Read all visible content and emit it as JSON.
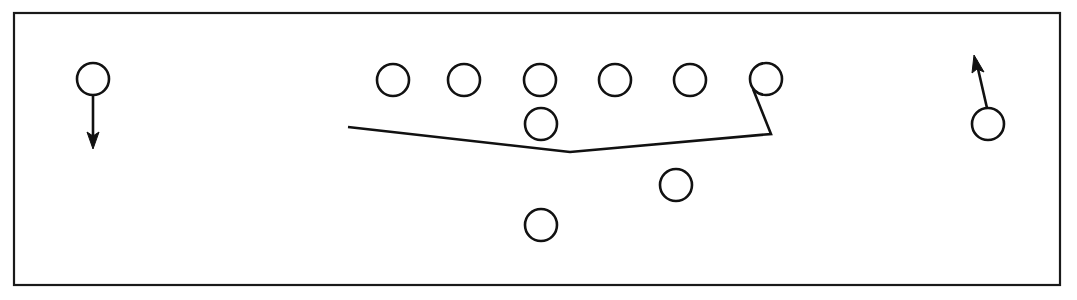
{
  "diagram": {
    "type": "football-play-diagram",
    "canvas": {
      "width": 1077,
      "height": 300
    },
    "colors": {
      "background": "#ffffff",
      "stroke": "#111111",
      "border": "#1a1a1a",
      "fill": "#ffffff"
    },
    "field_border": {
      "x": 14,
      "y": 13,
      "width": 1046,
      "height": 272
    },
    "players": [
      {
        "id": "left-wide-receiver",
        "label": "",
        "cx": 93,
        "cy": 79,
        "r": 16,
        "group": "left-split-end"
      },
      {
        "id": "line-player-1",
        "label": "",
        "cx": 393,
        "cy": 80,
        "r": 16,
        "group": "offensive-line"
      },
      {
        "id": "line-player-2",
        "label": "",
        "cx": 464,
        "cy": 80,
        "r": 16,
        "group": "offensive-line"
      },
      {
        "id": "line-player-3",
        "label": "",
        "cx": 540,
        "cy": 80,
        "r": 16,
        "group": "offensive-line"
      },
      {
        "id": "line-player-4",
        "label": "",
        "cx": 615,
        "cy": 80,
        "r": 16,
        "group": "offensive-line"
      },
      {
        "id": "line-player-5",
        "label": "",
        "cx": 690,
        "cy": 80,
        "r": 16,
        "group": "offensive-line"
      },
      {
        "id": "line-player-6",
        "label": "",
        "cx": 766,
        "cy": 79,
        "r": 16,
        "group": "offensive-line"
      },
      {
        "id": "quarterback",
        "label": "",
        "cx": 541,
        "cy": 124,
        "r": 16,
        "group": "backfield"
      },
      {
        "id": "back-right",
        "label": "",
        "cx": 676,
        "cy": 185,
        "r": 16,
        "group": "backfield"
      },
      {
        "id": "back-deep",
        "label": "",
        "cx": 541,
        "cy": 225,
        "r": 16,
        "group": "backfield"
      },
      {
        "id": "right-wide-receiver",
        "label": "",
        "cx": 988,
        "cy": 124,
        "r": 16,
        "group": "right-split-end"
      }
    ],
    "routes": [
      {
        "id": "blocking-scheme-line",
        "points": "348,127 570,152 771,134 753,89",
        "description": "blocking scheme polyline from left flat up through the V vertex to the right end"
      }
    ],
    "motions": [
      {
        "id": "left-receiver-route",
        "from": {
          "x": 93,
          "y": 95
        },
        "to": {
          "x": 93,
          "y": 145
        },
        "arrow_tip": {
          "x": 93,
          "y": 148
        },
        "direction": "down",
        "arrow_points": "93,149 87,132 93,136 99,132"
      },
      {
        "id": "right-receiver-route",
        "from": {
          "x": 987,
          "y": 108
        },
        "to": {
          "x": 976,
          "y": 60
        },
        "arrow_tip": {
          "x": 974,
          "y": 55
        },
        "direction": "up-left",
        "arrow_points": "974,55 972,73 977,69 984,72"
      }
    ]
  }
}
